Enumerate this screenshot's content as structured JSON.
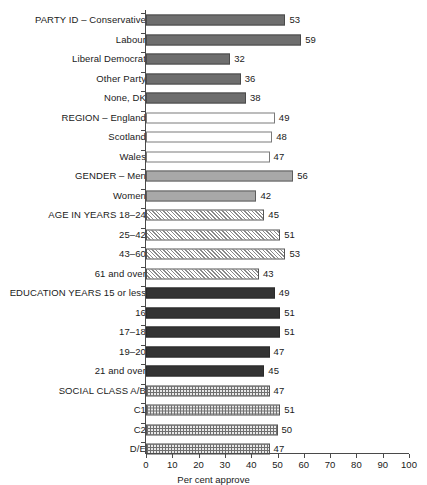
{
  "chart_data": {
    "type": "bar",
    "orientation": "horizontal",
    "title": "",
    "xlabel": "Per cent approve",
    "ylabel": "",
    "xlim": [
      0,
      100
    ],
    "xticks": [
      0,
      10,
      20,
      30,
      40,
      50,
      60,
      70,
      80,
      90,
      100
    ],
    "grid": false,
    "legend": "none",
    "categories": [
      "PARTY ID – Conservative",
      "Labour",
      "Liberal Democrat",
      "Other Party",
      "None, DK",
      "REGION – England",
      "Scotland",
      "Wales",
      "GENDER – Men",
      "Women",
      "AGE IN YEARS 18–24",
      "25–42",
      "43–60",
      "61 and over",
      "EDUCATION YEARS 15 or less",
      "16",
      "17–18",
      "19–20",
      "21 and over",
      "SOCIAL CLASS A/B",
      "C1",
      "C2",
      "D/E"
    ],
    "values": [
      53,
      59,
      32,
      36,
      38,
      49,
      48,
      47,
      56,
      42,
      45,
      51,
      53,
      43,
      49,
      51,
      51,
      47,
      45,
      47,
      51,
      50,
      47
    ],
    "groups": [
      {
        "name": "PARTY ID",
        "style": "solid-gray",
        "items": [
          {
            "label": "PARTY ID – Conservative",
            "value": 53
          },
          {
            "label": "Labour",
            "value": 59
          },
          {
            "label": "Liberal Democrat",
            "value": 32
          },
          {
            "label": "Other Party",
            "value": 36
          },
          {
            "label": "None, DK",
            "value": 38
          }
        ]
      },
      {
        "name": "REGION",
        "style": "white",
        "items": [
          {
            "label": "REGION – England",
            "value": 49
          },
          {
            "label": "Scotland",
            "value": 48
          },
          {
            "label": "Wales",
            "value": 47
          }
        ]
      },
      {
        "name": "GENDER",
        "style": "light-gray",
        "items": [
          {
            "label": "GENDER – Men",
            "value": 56
          },
          {
            "label": "Women",
            "value": 42
          }
        ]
      },
      {
        "name": "AGE IN YEARS",
        "style": "diagonal-hatch",
        "items": [
          {
            "label": "AGE IN YEARS 18–24",
            "value": 45
          },
          {
            "label": "25–42",
            "value": 51
          },
          {
            "label": "43–60",
            "value": 53
          },
          {
            "label": "61 and over",
            "value": 43
          }
        ]
      },
      {
        "name": "EDUCATION YEARS",
        "style": "dark-solid",
        "items": [
          {
            "label": "EDUCATION YEARS 15 or less",
            "value": 49
          },
          {
            "label": "16",
            "value": 51
          },
          {
            "label": "17–18",
            "value": 51
          },
          {
            "label": "19–20",
            "value": 47
          },
          {
            "label": "21 and over",
            "value": 45
          }
        ]
      },
      {
        "name": "SOCIAL CLASS",
        "style": "crosshatch",
        "items": [
          {
            "label": "SOCIAL CLASS A/B",
            "value": 47
          },
          {
            "label": "C1",
            "value": 51
          },
          {
            "label": "C2",
            "value": 50
          },
          {
            "label": "D/E",
            "value": 47
          }
        ]
      }
    ],
    "colors": {
      "party": "#6e6e6e",
      "region": "#ffffff",
      "gender": "#a8a8a8",
      "age": "#8a8a8a",
      "education": "#343434",
      "social_class": "#6f6f6f",
      "axis": "#4a4a4a",
      "text": "#1a1a1a"
    }
  }
}
